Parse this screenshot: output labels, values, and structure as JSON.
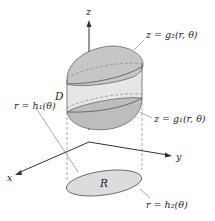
{
  "diagram": {
    "axes": {
      "x_label": "x",
      "y_label": "y",
      "z_label": "z"
    },
    "labels": {
      "upper_surface": "z = g₂(r, θ)",
      "lower_surface": "z = g₁(r, θ)",
      "inner_curve": "r = h₁(θ)",
      "outer_curve": "r = h₂(θ)",
      "solid": "D",
      "region": "R"
    },
    "colors": {
      "solid_fill": "#c9c9c9",
      "side_fill": "#e4e4e4",
      "region_fill": "#dcdcdc",
      "stroke": "#555555"
    }
  }
}
